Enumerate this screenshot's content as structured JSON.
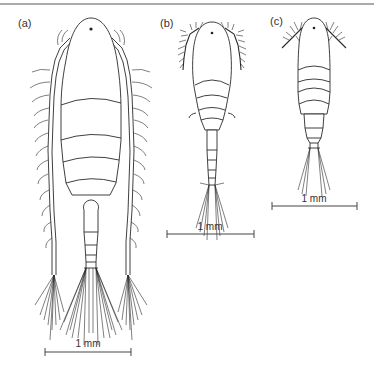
{
  "figure": {
    "panels": [
      {
        "id": "a",
        "label": "(a)",
        "scale_bar": {
          "label": "1 mm",
          "x1": 45,
          "x2": 131,
          "y": 352
        }
      },
      {
        "id": "b",
        "label": "(b)",
        "scale_bar": {
          "label": "1 mm",
          "x1": 167,
          "x2": 254,
          "y": 234
        }
      },
      {
        "id": "c",
        "label": "(c)",
        "scale_bar": {
          "label": "1 mm",
          "x1": 272,
          "x2": 357,
          "y": 206
        }
      }
    ],
    "colors": {
      "line": "#2a2a2a",
      "background": "#ffffff",
      "text": "#333333"
    }
  }
}
